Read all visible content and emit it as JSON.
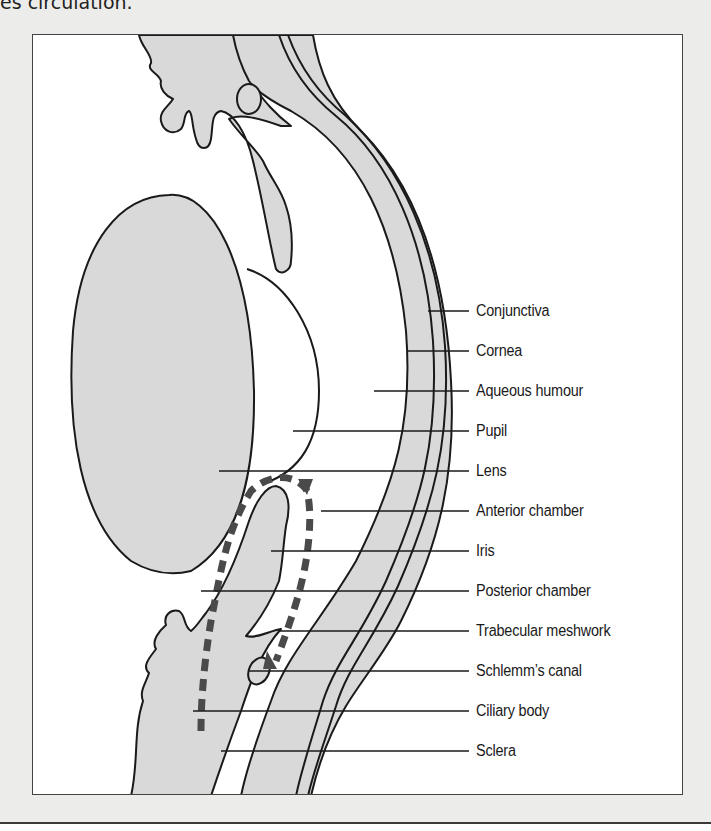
{
  "caption": "es circulation.",
  "figure": {
    "colors": {
      "tissue_fill": "#d9d9d9",
      "outline": "#1a1a1a",
      "flow_arrow": "#4a4a4a",
      "background": "#ececea",
      "panel": "#ffffff"
    },
    "labels": [
      {
        "text": "Conjunctiva",
        "y": 310,
        "line_start_x": 427
      },
      {
        "text": "Cornea",
        "y": 350,
        "line_start_x": 407
      },
      {
        "text": "Aqueous humour",
        "y": 390,
        "line_start_x": 373
      },
      {
        "text": "Pupil",
        "y": 430,
        "line_start_x": 292
      },
      {
        "text": "Lens",
        "y": 470,
        "line_start_x": 218
      },
      {
        "text": "Anterior chamber",
        "y": 510,
        "line_start_x": 320
      },
      {
        "text": "Iris",
        "y": 550,
        "line_start_x": 270
      },
      {
        "text": "Posterior chamber",
        "y": 590,
        "line_start_x": 200
      },
      {
        "text": "Trabecular meshwork",
        "y": 630,
        "line_start_x": 278
      },
      {
        "text": "Schlemm’s canal",
        "y": 670,
        "line_start_x": 248
      },
      {
        "text": "Ciliary body",
        "y": 710,
        "line_start_x": 192
      },
      {
        "text": "Sclera",
        "y": 750,
        "line_start_x": 220
      }
    ]
  }
}
